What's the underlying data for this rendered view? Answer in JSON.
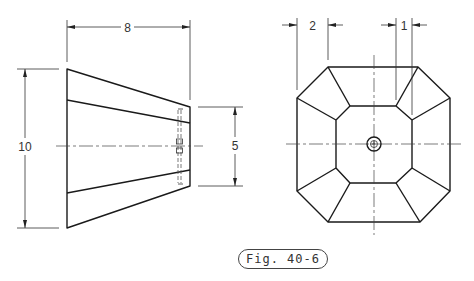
{
  "figure": {
    "caption": "Fig. 40-6"
  },
  "front_view": {
    "dimensions": {
      "length": "8",
      "large_height": "10",
      "small_height": "5"
    }
  },
  "side_view": {
    "dimensions": {
      "left_offset": "2",
      "right_offset": "1"
    }
  },
  "colors": {
    "line": "#1a1a1a",
    "background": "#ffffff"
  }
}
